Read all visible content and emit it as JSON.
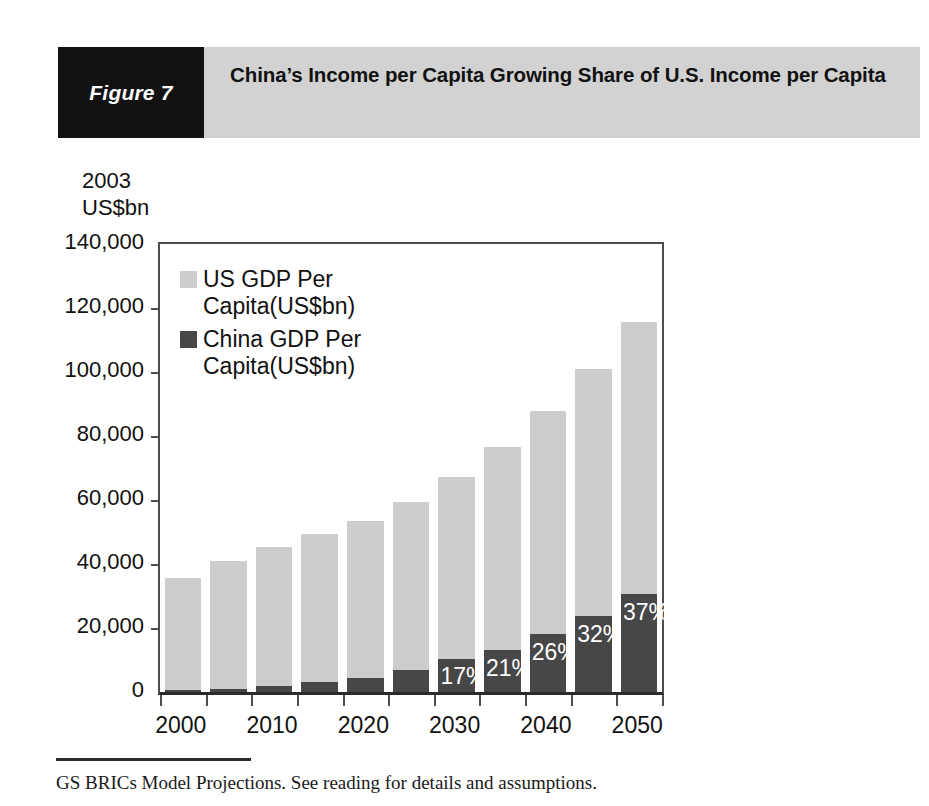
{
  "header": {
    "badge_label": "Figure 7",
    "title": "China’s Income per Capita Growing Share of U.S. Income per Capita",
    "badge_bg": "#121212",
    "header_bg": "#d2d2d2"
  },
  "footer": {
    "note": "GS BRICs Model Projections. See reading for details and assumptions."
  },
  "legend": {
    "position": "top-left-inside",
    "entries": [
      {
        "label": "US GDP Per Capita(US$bn)",
        "color": "#cdcdcd"
      },
      {
        "label": "China GDP Per Capita(US$bn)",
        "color": "#474747"
      }
    ]
  },
  "chart_data": {
    "type": "bar",
    "stacked": true,
    "title": "China’s Income per Capita Growing Share of U.S. Income per Capita",
    "xlabel": "",
    "ylabel": "2003 US$bn",
    "ylim": [
      0,
      140000
    ],
    "ytick_values": [
      0,
      20000,
      40000,
      60000,
      80000,
      100000,
      120000,
      140000
    ],
    "ytick_labels": [
      "0",
      "20,000",
      "40,000",
      "60,000",
      "80,000",
      "100,000",
      "120,000",
      "140,000"
    ],
    "grid": false,
    "categories": [
      2000,
      2005,
      2010,
      2015,
      2020,
      2025,
      2030,
      2035,
      2040,
      2045,
      2050
    ],
    "xtick_labels": [
      "2000",
      "",
      "2010",
      "",
      "2020",
      "",
      "2030",
      "",
      "2040",
      "",
      "2050"
    ],
    "series": [
      {
        "name": "US GDP Per Capita(US$bn)",
        "color": "#cdcdcd",
        "values": [
          35700,
          40800,
          45300,
          49500,
          53400,
          59500,
          67200,
          76600,
          87800,
          100800,
          115600
        ]
      },
      {
        "name": "China GDP Per Capita(US$bn)",
        "color": "#474747",
        "values": [
          500,
          900,
          1900,
          3000,
          4300,
          6900,
          10400,
          13200,
          18000,
          23600,
          30700
        ]
      }
    ],
    "annotations": [
      {
        "category": 2030,
        "text": "17%"
      },
      {
        "category": 2035,
        "text": "21%"
      },
      {
        "category": 2040,
        "text": "26%"
      },
      {
        "category": 2045,
        "text": "32%"
      },
      {
        "category": 2050,
        "text": "37%"
      }
    ]
  }
}
